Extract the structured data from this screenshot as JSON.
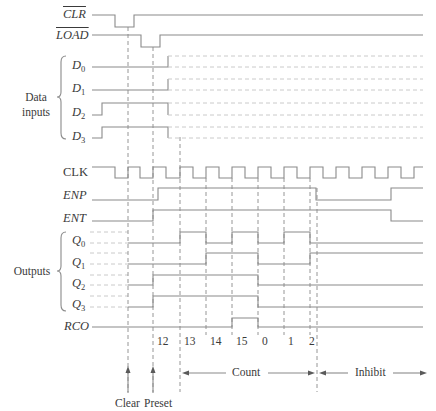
{
  "diagram": {
    "type": "timing-diagram",
    "signals": {
      "clr": {
        "label": "CLR",
        "active_low": true
      },
      "load": {
        "label": "LOAD",
        "active_low": true
      },
      "d0": {
        "label": "D",
        "sub": "0"
      },
      "d1": {
        "label": "D",
        "sub": "1"
      },
      "d2": {
        "label": "D",
        "sub": "2"
      },
      "d3": {
        "label": "D",
        "sub": "3"
      },
      "clk": {
        "label": "CLK"
      },
      "enp": {
        "label": "ENP"
      },
      "ent": {
        "label": "ENT"
      },
      "q0": {
        "label": "Q",
        "sub": "0"
      },
      "q1": {
        "label": "Q",
        "sub": "1"
      },
      "q2": {
        "label": "Q",
        "sub": "2"
      },
      "q3": {
        "label": "Q",
        "sub": "3"
      },
      "rco": {
        "label": "RCO"
      }
    },
    "groups": {
      "data_inputs": {
        "line1": "Data",
        "line2": "inputs"
      },
      "outputs": {
        "line1": "Outputs"
      }
    },
    "counts": [
      "12",
      "13",
      "14",
      "15",
      "0",
      "1",
      "2"
    ],
    "annotations": {
      "clear": "Clear",
      "preset": "Preset",
      "count": "Count",
      "inhibit": "Inhibit"
    },
    "colors": {
      "trace": "#8a8a8a",
      "text": "#3a3a3a",
      "ghost": "#c4c4c4"
    }
  }
}
